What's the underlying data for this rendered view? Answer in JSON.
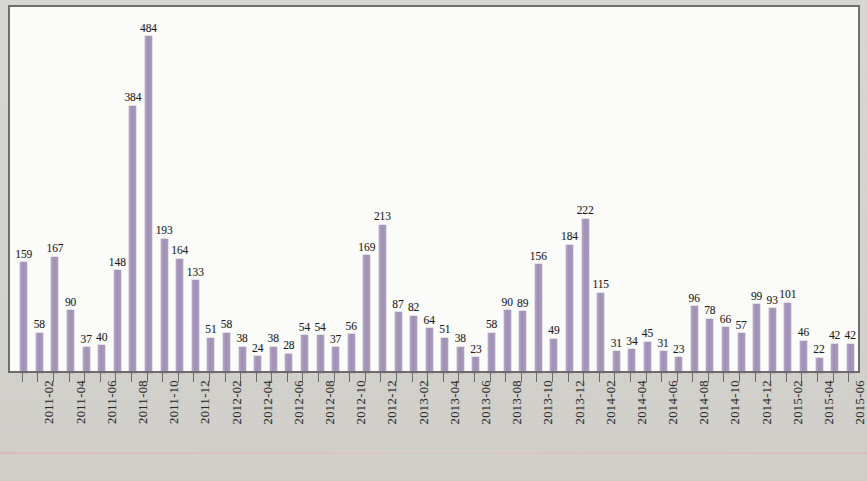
{
  "chart_data": {
    "type": "bar",
    "title": "",
    "subtitle": "",
    "xlabel": "",
    "ylabel": "",
    "ylim": [
      0,
      500
    ],
    "grid": false,
    "legend": null,
    "bar_color": "#a596b9",
    "axis_color": "#6b6b6b",
    "plot_background": "#fbfbfa",
    "page_background": "#d7d5d0",
    "data_labels_shown": true,
    "categories": [
      "2011-01",
      "2011-02",
      "2011-03",
      "2011-04",
      "2011-05",
      "2011-06",
      "2011-07",
      "2011-08",
      "2011-09",
      "2011-10",
      "2011-11",
      "2011-12",
      "2012-01",
      "2012-02",
      "2012-03",
      "2012-04",
      "2012-05",
      "2012-06",
      "2012-07",
      "2012-08",
      "2012-09",
      "2012-10",
      "2012-11",
      "2012-12",
      "2013-01",
      "2013-02",
      "2013-03",
      "2013-04",
      "2013-05",
      "2013-06",
      "2013-07",
      "2013-08",
      "2013-09",
      "2013-10",
      "2013-11",
      "2013-12",
      "2014-01",
      "2014-02",
      "2014-03",
      "2014-04",
      "2014-05",
      "2014-06",
      "2014-07",
      "2014-08",
      "2014-09",
      "2014-10",
      "2014-11",
      "2014-12",
      "2015-01",
      "2015-02",
      "2015-03",
      "2015-04",
      "2015-05",
      "2015-06"
    ],
    "values": [
      159,
      58,
      167,
      90,
      37,
      40,
      148,
      384,
      484,
      193,
      164,
      133,
      51,
      58,
      38,
      24,
      38,
      28,
      54,
      54,
      37,
      56,
      169,
      213,
      87,
      82,
      64,
      51,
      38,
      23,
      58,
      90,
      89,
      156,
      49,
      184,
      222,
      115,
      31,
      34,
      45,
      31,
      23,
      96,
      78,
      66,
      57,
      99,
      93,
      101,
      46,
      22,
      42,
      42
    ],
    "tick_labels": [
      "2011-02",
      "2011-04",
      "2011-06",
      "2011-08",
      "2011-10",
      "2011-12",
      "2012-02",
      "2012-04",
      "2012-06",
      "2012-08",
      "2012-10",
      "2012-12",
      "2013-02",
      "2013-04",
      "2013-06",
      "2013-08",
      "2013-10",
      "2013-12",
      "2014-02",
      "2014-04",
      "2014-06",
      "2014-08",
      "2014-10",
      "2014-12",
      "2015-02",
      "2015-04",
      "2015-06"
    ],
    "tick_label_indices": [
      1,
      3,
      5,
      7,
      9,
      11,
      13,
      15,
      17,
      19,
      21,
      23,
      25,
      27,
      29,
      31,
      33,
      35,
      37,
      39,
      41,
      43,
      45,
      47,
      49,
      51,
      53
    ],
    "tick_label_rotation": -90,
    "max_value": 484,
    "max_category": "2011-09",
    "min_value": 22,
    "min_category": "2015-04",
    "n_bars": 54
  }
}
